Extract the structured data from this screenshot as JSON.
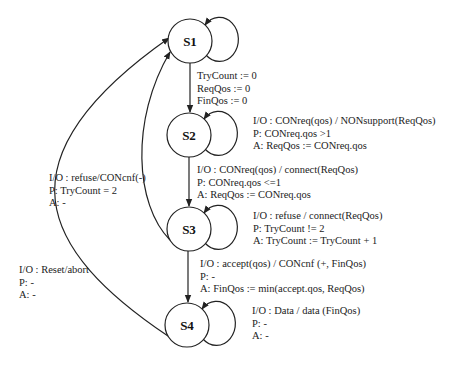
{
  "states": [
    {
      "id": "S1",
      "label": "S1",
      "cx": 190,
      "cy": 41
    },
    {
      "id": "S2",
      "label": "S2",
      "cx": 189,
      "cy": 135
    },
    {
      "id": "S3",
      "label": "S3",
      "cx": 189,
      "cy": 229
    },
    {
      "id": "S4",
      "label": "S4",
      "cx": 187,
      "cy": 325
    }
  ],
  "transitions": {
    "s1_to_s2": {
      "lines": [
        "TryCount := 0",
        "ReqQos := 0",
        "FinQos := 0"
      ]
    },
    "s2_self": {
      "io": "I/O : CONreq(qos) / NONsupport(ReqQos)",
      "p": "P: CONreq.qos >1",
      "a": "A: ReqQos := CONreq.qos"
    },
    "s2_to_s3": {
      "io": "I/O : CONreq(qos) / connect(ReqQos)",
      "p": "P: CONreq.qos <=1",
      "a": "A: ReqQos := CONreq.qos"
    },
    "s3_self": {
      "io": "I/O : refuse / connect(ReqQos)",
      "p": "P: TryCount != 2",
      "a": "A: TryCount := TryCount + 1"
    },
    "s3_to_s4": {
      "io": "I/O : accept(qos) / CONcnf (+, FinQos)",
      "p": "P: -",
      "a": "A: FinQos := min(accept.qos, ReqQos)"
    },
    "s4_self": {
      "io": "I/O : Data / data (FinQos)",
      "p": "P: -",
      "a": "A: -"
    },
    "s3_to_s1": {
      "io": "I/O : refuse/CONcnf(-)",
      "p": "P: TryCount = 2",
      "a": "A: -"
    },
    "s4_to_s1": {
      "io": "I/O : Reset/abort",
      "p": "P: -",
      "a": "A: -"
    }
  },
  "colors": {
    "stroke": "#222222",
    "background": "#ffffff"
  }
}
